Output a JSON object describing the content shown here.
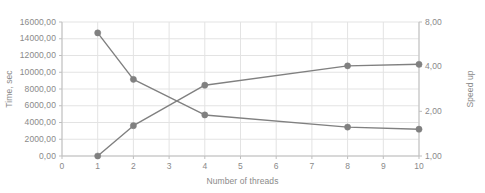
{
  "chart_data": {
    "type": "line",
    "title": "",
    "xlabel": "Number of threads",
    "ylabel": "Time, sec",
    "y2label": "Speed up",
    "x": [
      1,
      2,
      4,
      8,
      10
    ],
    "xlim": [
      0,
      10
    ],
    "xticks": [
      "0",
      "1",
      "2",
      "3",
      "4",
      "5",
      "6",
      "7",
      "8",
      "9",
      "10"
    ],
    "ylim": [
      0,
      16000
    ],
    "yticks": [
      "0,00",
      "2000,00",
      "4000,00",
      "6000,00",
      "8000,00",
      "10000,00",
      "12000,00",
      "14000,00",
      "16000,00"
    ],
    "y2scale": "log2",
    "y2lim": [
      1,
      8
    ],
    "y2ticks": [
      "1,00",
      "2,00",
      "4,00",
      "8,00"
    ],
    "grid": true,
    "legend": "none",
    "series": [
      {
        "name": "Time, sec",
        "axis": "left",
        "color": "#808080",
        "values": [
          14700,
          9150,
          4900,
          3450,
          3200
        ]
      },
      {
        "name": "Speed up",
        "axis": "right",
        "color": "#808080",
        "values": [
          1.0,
          1.6,
          3.0,
          4.05,
          4.15
        ]
      }
    ]
  },
  "axes": {
    "left_title": "Time, sec",
    "right_title": "Speed up",
    "x_title": "Number of threads"
  },
  "colors": {
    "series": "#808080",
    "grid": "#e3e3e3",
    "axis": "#bfbfbf",
    "text": "#8a8a8a"
  }
}
